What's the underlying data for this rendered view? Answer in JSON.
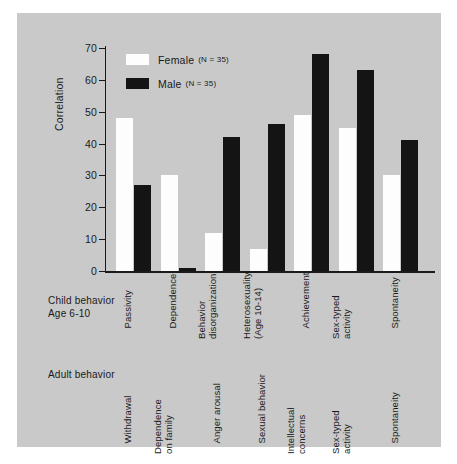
{
  "chart_data": {
    "type": "bar",
    "title": "",
    "xlabel": "",
    "ylabel": "Correlation",
    "ylim": [
      0,
      70
    ],
    "yticks": [
      0,
      10,
      20,
      30,
      40,
      50,
      60,
      70
    ],
    "grid": false,
    "legend_position": "top-left",
    "categories": [
      "Passivity",
      "Dependence",
      "Behavior disorganization",
      "Heterosexuality (Age 10-14)",
      "Achievement",
      "Sex-typed activity",
      "Spontaneity"
    ],
    "series": [
      {
        "name": "Female",
        "n": 35,
        "color": "#fdfdfd",
        "values": [
          48,
          30,
          12,
          7,
          49,
          45,
          30
        ]
      },
      {
        "name": "Male",
        "n": 35,
        "color": "#141414",
        "values": [
          27,
          1,
          42,
          46,
          68,
          63,
          41
        ]
      }
    ]
  },
  "legend": {
    "items": [
      {
        "label": "Female",
        "n_text": "(N = 35)",
        "swatch": "female"
      },
      {
        "label": "Male",
        "n_text": "(N = 35)",
        "swatch": "male"
      }
    ]
  },
  "axes": {
    "y_title": "Correlation",
    "y_ticks": [
      "70",
      "60",
      "50",
      "40",
      "30",
      "20",
      "10",
      "0"
    ]
  },
  "rows": {
    "child": {
      "title": "Child behavior\nAge 6-10",
      "labels": [
        "Passivity",
        "Dependence",
        "Behavior\ndisorganization",
        "Heterosexuality\n(Age 10-14)",
        "Achievement",
        "Sex-typed\nactivity",
        "Spontaneity"
      ]
    },
    "adult": {
      "title": "Adult behavior",
      "labels": [
        "Withdrawal",
        "Dependence\non family",
        "Anger arousal",
        "Sexual behavior",
        "Intellectual\nconcerns",
        "Sex-typed\nactivity",
        "Spontaneity"
      ]
    }
  },
  "colors": {
    "panel_background": "#c9c9c9",
    "page_background": "#ffffff",
    "ink": "#1a1a1a",
    "female_bar": "#fdfdfd",
    "male_bar": "#141414"
  }
}
